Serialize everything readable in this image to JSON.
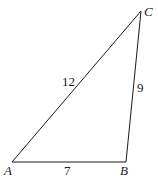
{
  "diagram": {
    "type": "triangle",
    "vertices": {
      "A": {
        "label": "A"
      },
      "B": {
        "label": "B"
      },
      "C": {
        "label": "C"
      }
    },
    "sides": {
      "AC": {
        "label": "12"
      },
      "BC": {
        "label": "9"
      },
      "AB": {
        "label": "7"
      }
    },
    "colors": {
      "stroke": "#1a1a1a",
      "background": "#ffffff"
    }
  }
}
